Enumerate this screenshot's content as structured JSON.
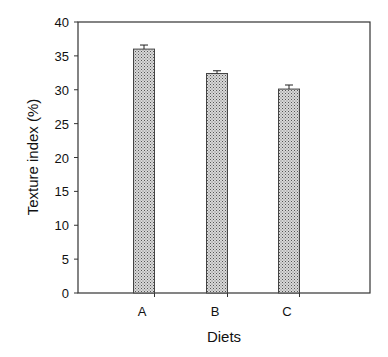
{
  "chart_data": {
    "type": "bar",
    "title": "",
    "xlabel": "Diets",
    "ylabel": "Texture index  (%)",
    "categories": [
      "A",
      "B",
      "C"
    ],
    "values": [
      36.0,
      32.4,
      30.1
    ],
    "error_bars": [
      0.6,
      0.4,
      0.6
    ],
    "ylim": [
      0,
      40
    ],
    "yticks": [
      0,
      5,
      10,
      15,
      20,
      25,
      30,
      35,
      40
    ],
    "grid": false,
    "legend": null,
    "bar_fill": "stippled gray",
    "colors": {
      "bar": "#b8b8b8",
      "frame": "#333333"
    }
  }
}
